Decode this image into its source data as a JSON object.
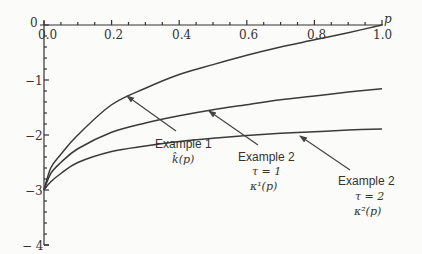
{
  "chart_data": {
    "type": "line",
    "title": "",
    "xlabel": "p",
    "ylabel": "",
    "xlim": [
      0.0,
      1.0
    ],
    "ylim": [
      -4,
      0
    ],
    "x_ticks": [
      "0.0",
      "0.2",
      "0.4",
      "0.6",
      "0.8",
      "1.0"
    ],
    "y_ticks": [
      "0",
      "-1",
      "-2",
      "-3",
      "-4"
    ],
    "grid": false,
    "legend": "none (arrow annotations)",
    "x": [
      0.0,
      0.02,
      0.05,
      0.1,
      0.2,
      0.3,
      0.4,
      0.5,
      0.6,
      0.7,
      0.8,
      0.9,
      1.0
    ],
    "series": [
      {
        "name": "Example 1 k̂(p)",
        "values": [
          -3.0,
          -2.6,
          -2.35,
          -2.0,
          -1.45,
          -1.15,
          -0.9,
          -0.72,
          -0.55,
          -0.4,
          -0.27,
          -0.14,
          0.0
        ]
      },
      {
        "name": "Example 2 τ=1 κ^1(p)",
        "values": [
          -3.0,
          -2.7,
          -2.5,
          -2.25,
          -1.95,
          -1.78,
          -1.65,
          -1.54,
          -1.45,
          -1.36,
          -1.29,
          -1.22,
          -1.16
        ]
      },
      {
        "name": "Example 2 τ=2 κ^2(p)",
        "values": [
          -3.0,
          -2.85,
          -2.7,
          -2.5,
          -2.3,
          -2.2,
          -2.12,
          -2.06,
          -2.01,
          -1.97,
          -1.94,
          -1.91,
          -1.89
        ]
      }
    ],
    "annotations": [
      {
        "lines": [
          "Example 1",
          "k̂(p)"
        ],
        "points_to": "Example 1 curve"
      },
      {
        "lines": [
          "Example 2",
          "τ = 1",
          "κ¹(p)"
        ],
        "points_to": "Example 2 τ=1 curve"
      },
      {
        "lines": [
          "Example 2",
          "τ = 2",
          "κ²(p)"
        ],
        "points_to": "Example 2 τ=2 curve"
      }
    ]
  },
  "labels": {
    "x_axis": "p",
    "x_ticks": [
      "0.0",
      "0.2",
      "0.4",
      "0.6",
      "0.8",
      "1.0"
    ],
    "y_ticks": [
      "0",
      "−1",
      "−2",
      "−3",
      "− 4"
    ],
    "ann1": {
      "l1": "Example 1",
      "l2": "k̂(p)"
    },
    "ann2": {
      "l1": "Example 2",
      "l2": "τ = 1",
      "l3": "κ¹(p)"
    },
    "ann3": {
      "l1": "Example 2",
      "l2": "τ = 2",
      "l3": "κ²(p)"
    }
  }
}
